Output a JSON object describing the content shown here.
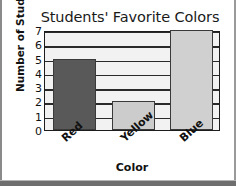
{
  "chart_data": {
    "type": "bar",
    "title": "Students' Favorite Colors",
    "xlabel": "Color",
    "ylabel": "Number of Students",
    "categories": [
      "Red",
      "Yellow",
      "Blue"
    ],
    "values": [
      5,
      2,
      7
    ],
    "ylim": [
      0,
      7
    ],
    "yticks": [
      7,
      6,
      5,
      4,
      3,
      2,
      1,
      0
    ],
    "grid": true,
    "legend": "none",
    "bar_colors": [
      "#595959",
      "#cccccc",
      "#d0d0d0"
    ],
    "series": [
      {
        "name": "Number of Students",
        "values": [
          5,
          2,
          7
        ]
      }
    ],
    "bars": [
      {
        "category": "Red",
        "value": 5,
        "fill": "#595959"
      },
      {
        "category": "Yellow",
        "value": 2,
        "fill": "#cccccc"
      },
      {
        "category": "Blue",
        "value": 7,
        "fill": "#d0d0d0"
      }
    ]
  },
  "style": {
    "plot_background": "#f2f2f2",
    "axis_color": "#1d1d1d",
    "grid_color": "#2a2a2a",
    "text_color": "#111111"
  }
}
